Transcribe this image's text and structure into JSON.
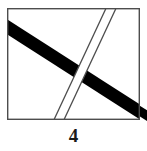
{
  "figure": {
    "caption": "4",
    "background_color": "#ffffff",
    "stroke_color": "#4d4d4d",
    "fill_color": "#000000",
    "frame": {
      "label": "rectangular border",
      "x": 7,
      "y": 8,
      "width": 133,
      "height": 112,
      "stroke_width": 1.4
    },
    "bands": [
      {
        "name": "thick-black-band",
        "style": "solid-filled",
        "color": "#000000",
        "description": "thick black diagonal band running from upper-left edge to lower-right corner, passing under the outlined band",
        "start_x": 0,
        "start_y": 18,
        "end_x": 147,
        "end_y": 122,
        "thickness": 15,
        "z_order": 1
      },
      {
        "name": "thin-outlined-band",
        "style": "double-line-outline",
        "color": "#4d4d4d",
        "description": "narrow white band with two parallel outline edges running from top edge down to bottom edge, drawn over the black band",
        "top_x": 113,
        "top_y": 8,
        "bottom_x": 57,
        "bottom_y": 120,
        "width": 9,
        "stroke_width": 1.3,
        "z_order": 2
      }
    ]
  }
}
